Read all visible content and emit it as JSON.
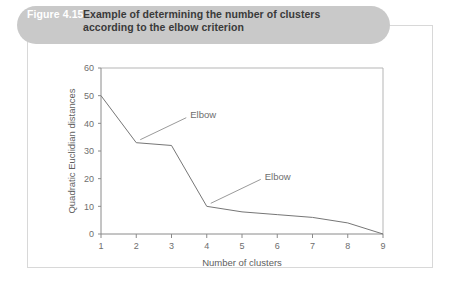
{
  "figure": {
    "number_label": "Figure 4.15",
    "caption_line1": "Example of determining the number of clusters",
    "caption_line2": "according to the elbow criterion",
    "banner_color": "#c9c9c9",
    "number_color": "#ffffff",
    "caption_color": "#3a3a3a"
  },
  "chart_data": {
    "type": "line",
    "title": "",
    "xlabel": "Number of clusters",
    "ylabel": "Quadratic Euclidian distances",
    "x": [
      1,
      2,
      3,
      4,
      5,
      6,
      7,
      8,
      9
    ],
    "values": [
      50,
      33,
      32,
      10,
      8,
      7,
      6,
      4,
      0
    ],
    "xticklabels": [
      "1",
      "2",
      "3",
      "4",
      "5",
      "6",
      "7",
      "8",
      "9"
    ],
    "yticklabels": [
      "0",
      "10",
      "20",
      "30",
      "40",
      "50",
      "60"
    ],
    "yticks": [
      0,
      10,
      20,
      30,
      40,
      50,
      60
    ],
    "xlim": [
      1,
      9
    ],
    "ylim": [
      0,
      60
    ],
    "grid": false,
    "legend": false,
    "line_color": "#767676",
    "annotations": [
      {
        "text": "Elbow",
        "target_x": 2,
        "target_y": 33
      },
      {
        "text": "Elbow",
        "target_x": 4,
        "target_y": 10
      }
    ]
  }
}
